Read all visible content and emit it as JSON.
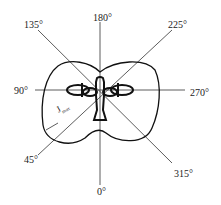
{
  "diagram": {
    "angles": {
      "a0": "0°",
      "a45": "45°",
      "a90": "90°",
      "a135": "135°",
      "a180": "180°",
      "a225": "225°",
      "a270": "270°",
      "a315": "315°"
    },
    "radius_label": "J",
    "radius_sub": "max"
  }
}
